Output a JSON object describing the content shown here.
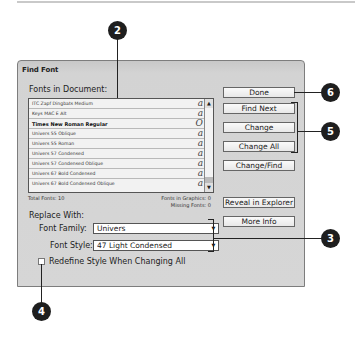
{
  "dialog": {
    "title": "Find Font",
    "fonts_label": "Fonts in Document:",
    "fonts": [
      {
        "name": "ITC Zapf Dingbats Medium",
        "bold": false,
        "icon": "a"
      },
      {
        "name": "Keys MAC E  Alt",
        "bold": false,
        "icon": "a"
      },
      {
        "name": "Times New Roman Regular",
        "bold": true,
        "icon": "O"
      },
      {
        "name": "Univers 55 Oblique",
        "bold": false,
        "icon": "a"
      },
      {
        "name": "Univers 55 Roman",
        "bold": false,
        "icon": "a"
      },
      {
        "name": "Univers 57 Condensed",
        "bold": false,
        "icon": "a"
      },
      {
        "name": "Univers 57 Condensed Oblique",
        "bold": false,
        "icon": "a"
      },
      {
        "name": "Univers 67 Bold Condensed",
        "bold": false,
        "icon": "a"
      },
      {
        "name": "Univers 67 Bold Condensed Oblique",
        "bold": false,
        "icon": "a"
      }
    ],
    "total_fonts": "Total Fonts: 10",
    "fonts_in_graphics": "Fonts in Graphics: 0",
    "missing_fonts": "Missing Fonts: 0",
    "replace_with": "Replace With:",
    "font_family_label": "Font Family:",
    "font_family_value": "Univers",
    "font_style_label": "Font Style:",
    "font_style_value": "47 Light Condensed",
    "redefine_label": "Redefine Style When Changing All",
    "redefine_checked": false,
    "buttons": {
      "done": "Done",
      "find_next": "Find Next",
      "change": "Change",
      "change_all": "Change All",
      "change_find": "Change/Find",
      "reveal": "Reveal in Explorer",
      "more_info": "More Info"
    }
  },
  "callouts": {
    "c2": "2",
    "c3": "3",
    "c4": "4",
    "c5": "5",
    "c6": "6"
  }
}
